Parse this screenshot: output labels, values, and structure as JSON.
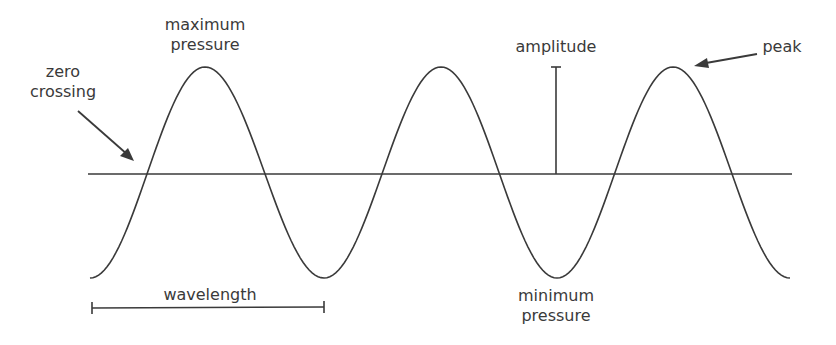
{
  "labels": {
    "max_pressure_line1": "maximum",
    "max_pressure_line2": "pressure",
    "zero_crossing_line1": "zero",
    "zero_crossing_line2": "crossing",
    "amplitude": "amplitude",
    "peak": "peak",
    "wavelength": "wavelength",
    "min_pressure_line1": "minimum",
    "min_pressure_line2": "pressure"
  },
  "colors": {
    "stroke": "#3a3a3a",
    "text": "#3a3a3a",
    "background": "#ffffff"
  },
  "wave": {
    "axis_y": 174,
    "peak_y": 67,
    "trough_y": 278,
    "start_x": 90,
    "end_x": 790,
    "peaks_x": [
      205,
      441,
      673
    ],
    "troughs_x": [
      324,
      557
    ],
    "zero_crossings_x": [
      146,
      265,
      383,
      500,
      616,
      733
    ]
  }
}
